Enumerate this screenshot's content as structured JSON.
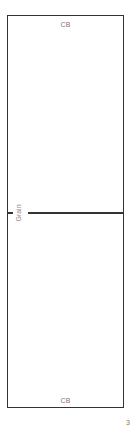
{
  "pattern_piece": {
    "top_label": "CB",
    "bottom_label": "CB",
    "grainline_label": "Grain",
    "colors": {
      "outline": "#333333",
      "label_text": "#777777"
    }
  },
  "page": {
    "number": "3"
  }
}
